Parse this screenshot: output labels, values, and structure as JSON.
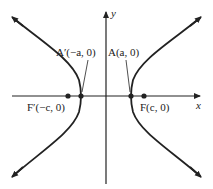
{
  "diagram": {
    "type": "hyperbola",
    "axes": {
      "x_label": "x",
      "y_label": "y"
    },
    "points": [
      {
        "id": "vertex-right",
        "label": "A(a, 0)",
        "x": 131,
        "y": 96
      },
      {
        "id": "vertex-left",
        "label": "A′(−a, 0)",
        "x": 81,
        "y": 96
      },
      {
        "id": "focus-right",
        "label": "F(c, 0)",
        "x": 144,
        "y": 96
      },
      {
        "id": "focus-left",
        "label": "F′(−c, 0)",
        "x": 68,
        "y": 96
      }
    ],
    "labels": {
      "vertex_right": "A(a, 0)",
      "vertex_left": "A′(−a, 0)",
      "focus_right": "F(c, 0)",
      "focus_left": "F′(−c, 0)",
      "x_axis": "x",
      "y_axis": "y"
    },
    "colors": {
      "stroke": "#222222",
      "background": "#ffffff"
    }
  }
}
